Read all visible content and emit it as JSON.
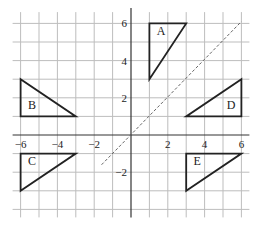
{
  "diagram": {
    "type": "coordinate-grid",
    "axes": {
      "x_ticks": [
        -6,
        -4,
        -2,
        2,
        4,
        6
      ],
      "y_ticks": [
        6,
        4,
        2,
        -2
      ],
      "x_range": [
        -6,
        6
      ],
      "y_range": [
        -4,
        6.5
      ],
      "grid_step": 1
    },
    "mirror_line": {
      "equation": "y = x",
      "from": [
        -1.6,
        -1.6
      ],
      "to": [
        6,
        6.1
      ],
      "style": "dashed"
    },
    "shapes": [
      {
        "label": "A",
        "vertices": [
          [
            1,
            6
          ],
          [
            3,
            6
          ],
          [
            1,
            3
          ]
        ],
        "label_pos": [
          1.4,
          5.4
        ]
      },
      {
        "label": "B",
        "vertices": [
          [
            -6,
            3
          ],
          [
            -6,
            1
          ],
          [
            -3,
            1
          ]
        ],
        "label_pos": [
          -5.6,
          1.4
        ]
      },
      {
        "label": "C",
        "vertices": [
          [
            -6,
            -1
          ],
          [
            -3,
            -1
          ],
          [
            -6,
            -3
          ]
        ],
        "label_pos": [
          -5.6,
          -1.6
        ]
      },
      {
        "label": "D",
        "vertices": [
          [
            6,
            3
          ],
          [
            6,
            1
          ],
          [
            3,
            1
          ]
        ],
        "label_pos": [
          5.2,
          1.4
        ]
      },
      {
        "label": "E",
        "vertices": [
          [
            3,
            -1
          ],
          [
            6,
            -1
          ],
          [
            3,
            -3
          ]
        ],
        "label_pos": [
          3.4,
          -1.6
        ]
      }
    ],
    "colors": {
      "grid": "#bdbdbd",
      "axis": "#333333",
      "shape": "#222222",
      "mirror": "#666666"
    }
  }
}
